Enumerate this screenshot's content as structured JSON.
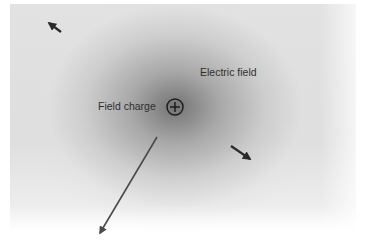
{
  "diagram": {
    "labels": {
      "field_charge": "Field charge",
      "electric_field": "Electric field"
    },
    "charge": {
      "sign": "+",
      "icon": "positive-charge-icon",
      "center": [
        175,
        107
      ],
      "radius": 8
    },
    "arrows": [
      {
        "name": "field-vector-upper-left",
        "from": [
          61,
          32
        ],
        "to": [
          49,
          23
        ],
        "color": "#2a2a2a",
        "width": 2.2
      },
      {
        "name": "field-vector-right",
        "from": [
          231,
          146
        ],
        "to": [
          250,
          159
        ],
        "color": "#2a2a2a",
        "width": 2.2
      },
      {
        "name": "field-vector-long-down-left",
        "from": [
          157,
          137
        ],
        "to": [
          100,
          233
        ],
        "color": "#4a4a4a",
        "width": 1.6
      }
    ],
    "colors": {
      "background": "#ffffff",
      "field_shade": "#6e6e6e",
      "text": "#2e2e2e",
      "arrow": "#2a2a2a"
    }
  }
}
